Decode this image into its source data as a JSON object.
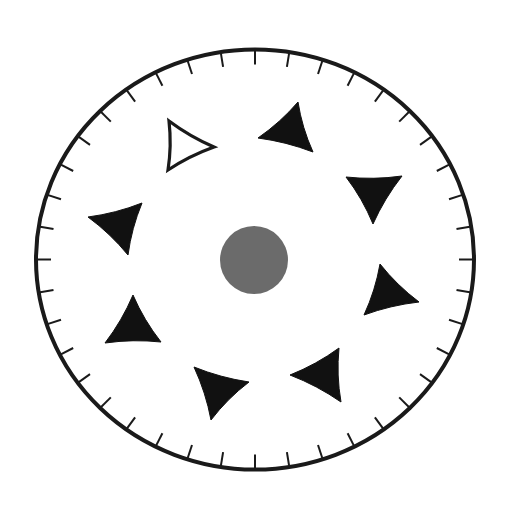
{
  "diagram": {
    "kind": "circular-dial-with-triangles",
    "dial": {
      "tick_count": 40,
      "ring_color": "#1a1a1a",
      "tick_color": "#1a1a1a"
    },
    "center_dot": {
      "color": "#6b6b6b"
    },
    "triangles": [
      {
        "id": "outlined-top-left",
        "filled": false,
        "color": "#1a1a1a"
      },
      {
        "id": "top",
        "filled": true,
        "color": "#111111"
      },
      {
        "id": "right-upper",
        "filled": true,
        "color": "#111111"
      },
      {
        "id": "right-lower",
        "filled": true,
        "color": "#111111"
      },
      {
        "id": "bottom-right",
        "filled": true,
        "color": "#111111"
      },
      {
        "id": "bottom",
        "filled": true,
        "color": "#111111"
      },
      {
        "id": "bottom-left",
        "filled": true,
        "color": "#111111"
      },
      {
        "id": "left",
        "filled": true,
        "color": "#111111"
      }
    ],
    "counts": {
      "filled_triangles": 7,
      "outlined_triangles": 1
    }
  }
}
